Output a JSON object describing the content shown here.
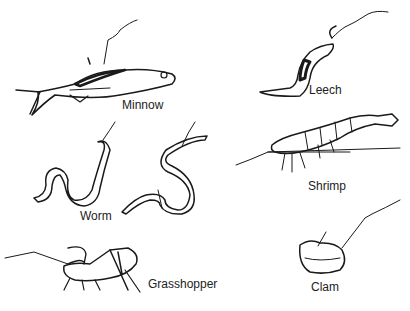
{
  "figure": {
    "type": "illustration",
    "ink_color": "#1a1a1a",
    "background_color": "#ffffff"
  },
  "baits": [
    {
      "id": "minnow",
      "label": "Minnow"
    },
    {
      "id": "leech",
      "label": "Leech"
    },
    {
      "id": "worm",
      "label": "Worm"
    },
    {
      "id": "shrimp",
      "label": "Shrimp"
    },
    {
      "id": "grasshopper",
      "label": "Grasshopper"
    },
    {
      "id": "clam",
      "label": "Clam"
    }
  ]
}
